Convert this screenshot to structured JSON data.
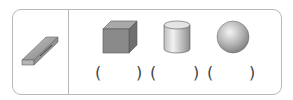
{
  "exercise": {
    "reference_object": {
      "name": "eraser",
      "icon": "eraser-icon"
    },
    "shapes": [
      {
        "name": "cube",
        "icon": "cube-icon"
      },
      {
        "name": "cylinder",
        "icon": "cylinder-icon"
      },
      {
        "name": "sphere",
        "icon": "sphere-icon"
      }
    ],
    "answer_blanks": [
      {
        "open": "(",
        "close": ")",
        "value": ""
      },
      {
        "open": "(",
        "close": ")",
        "value": ""
      },
      {
        "open": "(",
        "close": ")",
        "value": ""
      }
    ]
  },
  "colors": {
    "border": "#b8b8b8",
    "shape_gray": "#8a8a8a"
  }
}
